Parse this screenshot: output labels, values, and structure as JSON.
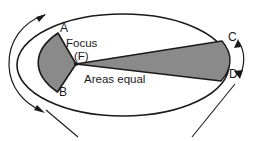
{
  "figure": {
    "labels": {
      "point_a": "A",
      "point_b": "B",
      "point_c": "C",
      "point_d": "D",
      "focus_line1": "Focus",
      "focus_line2": "(F)",
      "areas_equal": "Areas equal"
    },
    "colors": {
      "sector_fill": "#8a8a8a",
      "sector_stroke": "#1a1a1a",
      "orbit_stroke": "#1a1a1a",
      "arrow_stroke": "#1a1a1a",
      "background": "#ffffff",
      "text": "#1a1a1a"
    },
    "geometry": {
      "ellipse_center_x": 123,
      "ellipse_center_y": 65,
      "ellipse_radius_x": 106,
      "ellipse_radius_y": 51,
      "focus_x": 76,
      "focus_y": 64
    },
    "icons": {
      "left_direction_arrow": "curved-arrow-icon",
      "right_span_arrow": "curved-double-arrow-icon",
      "leader_left": "leader-line-icon",
      "leader_right": "leader-line-icon"
    }
  }
}
